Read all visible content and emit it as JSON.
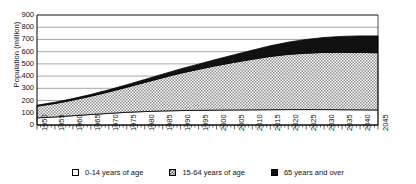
{
  "chart_data": {
    "type": "area",
    "stacked": true,
    "title": "",
    "xlabel": "",
    "ylabel": "Population (million)",
    "ylim": [
      0,
      900
    ],
    "ytick_step": 100,
    "yticks": [
      0,
      100,
      200,
      300,
      400,
      500,
      600,
      700,
      800,
      900
    ],
    "xlim": [
      1950,
      2045
    ],
    "grid": true,
    "grid_axis": "y",
    "legend_position": "bottom",
    "categories": [
      1950,
      1955,
      1960,
      1965,
      1970,
      1975,
      1980,
      1985,
      1990,
      1995,
      2000,
      2005,
      2010,
      2015,
      2020,
      2025,
      2030,
      2035,
      2040,
      2045
    ],
    "xtick_labels": [
      "1950",
      "1955",
      "1960",
      "1965",
      "1970",
      "1975",
      "1980",
      "1985",
      "1990",
      "1995",
      "2000",
      "2005",
      "2010",
      "2015",
      "2020",
      "2025",
      "2030",
      "2035",
      "2040",
      "2045"
    ],
    "series": [
      {
        "name": "0-14 years of age",
        "swatch": "white-square",
        "fill": "#ffffff",
        "values": [
          58,
          66,
          76,
          86,
          95,
          104,
          110,
          115,
          118,
          120,
          122,
          123,
          124,
          125,
          126,
          126,
          126,
          125,
          124,
          123
        ]
      },
      {
        "name": "15-64 years of age",
        "swatch": "crosshatch-square",
        "fill": "#b8b8b8",
        "values": [
          96,
          110,
          128,
          150,
          176,
          205,
          238,
          272,
          306,
          336,
          364,
          390,
          414,
          436,
          452,
          462,
          468,
          470,
          470,
          468
        ]
      },
      {
        "name": "65 years and over",
        "swatch": "black-square",
        "fill": "#111111",
        "values": [
          8,
          10,
          12,
          14,
          17,
          20,
          24,
          29,
          35,
          42,
          51,
          62,
          74,
          87,
          100,
          112,
          122,
          130,
          135,
          138
        ]
      }
    ],
    "totals": [
      162,
      186,
      216,
      250,
      288,
      329,
      372,
      416,
      459,
      498,
      537,
      575,
      612,
      648,
      678,
      700,
      716,
      725,
      729,
      729
    ]
  },
  "legend": {
    "items": [
      {
        "label": "0-14 years of age"
      },
      {
        "label": "15-64 years of age"
      },
      {
        "label": "65 years and over"
      }
    ]
  }
}
